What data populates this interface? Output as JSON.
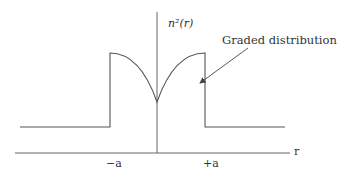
{
  "diagram": {
    "type": "refractive-index-profile",
    "y_axis_label": "n²(r)",
    "x_axis_label": "r",
    "annotation": "Graded distribution",
    "ticks": [
      {
        "label": "−a"
      },
      {
        "label": "+a"
      }
    ],
    "colors": {
      "line": "#555555",
      "axis": "#666666",
      "text": "#333333"
    }
  }
}
